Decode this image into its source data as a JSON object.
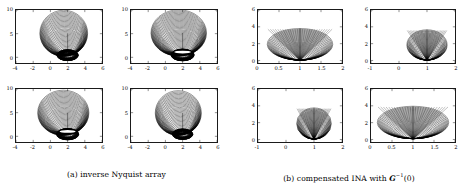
{
  "figure": {
    "background": "#ffffff",
    "axis_color": "#1a1a1a",
    "curve_color": "#000000"
  },
  "captions": {
    "a": {
      "tag": "(a)",
      "text": "inverse Nyquist array",
      "full": "(a) inverse Nyquist array"
    },
    "b": {
      "tag": "(b)",
      "text_before": "compensated INA with",
      "symbol": "G",
      "exponent": "−1",
      "arg": "(0)",
      "full": "(b) compensated INA with G−1(0)"
    }
  },
  "chart_data": [
    {
      "id": "a-11",
      "group": "a",
      "row": 0,
      "col": 0,
      "type": "line",
      "title": "",
      "xlabel": "",
      "ylabel": "",
      "xlim": [
        -4,
        6
      ],
      "ylim": [
        -1.2,
        10
      ],
      "xticks": [
        -4,
        -2,
        0,
        2,
        4,
        6
      ],
      "xticklabels": [
        "-4",
        "-2",
        "0",
        "2",
        "4",
        "6"
      ],
      "yticks": [
        0,
        5,
        10
      ],
      "yticklabels": [
        "0",
        "5",
        "10"
      ],
      "grid": false,
      "legend": null,
      "shape": "nyquist-band-bulb",
      "band_count": 34,
      "description": "Family of nested Gershgorin-type ovals forming a wide lobe from y=10 down to a dense dark bulb centred near x=2, y=0",
      "center_x": 1.55,
      "lobe_top_y": 9.7,
      "lobe_width": 5.2,
      "bulb_center": [
        2.0,
        0.45
      ],
      "bulb_radius": 1.25,
      "has_white_slit": false
    },
    {
      "id": "a-12",
      "group": "a",
      "row": 0,
      "col": 1,
      "type": "line",
      "xlim": [
        -4,
        6
      ],
      "ylim": [
        -1.2,
        10
      ],
      "xticks": [
        -4,
        -2,
        0,
        2,
        4,
        6
      ],
      "xticklabels": [
        "-4",
        "-2",
        "0",
        "2",
        "4",
        "6"
      ],
      "yticks": [
        0,
        5,
        10
      ],
      "yticklabels": [
        "0",
        "5",
        "10"
      ],
      "grid": false,
      "shape": "nyquist-band-bulb",
      "band_count": 36,
      "center_x": 1.55,
      "lobe_top_y": 9.8,
      "lobe_width": 6.1,
      "bulb_center": [
        2.0,
        0.5
      ],
      "bulb_radius": 1.35,
      "has_white_slit": true
    },
    {
      "id": "a-21",
      "group": "a",
      "row": 1,
      "col": 0,
      "type": "line",
      "xlim": [
        -4,
        6
      ],
      "ylim": [
        -1.2,
        10
      ],
      "xticks": [
        -4,
        -2,
        0,
        2,
        4,
        6
      ],
      "xticklabels": [
        "-4",
        "-2",
        "0",
        "2",
        "4",
        "6"
      ],
      "yticks": [
        0,
        5,
        10
      ],
      "yticklabels": [
        "0",
        "5",
        "10"
      ],
      "grid": false,
      "shape": "nyquist-band-bulb",
      "band_count": 34,
      "center_x": 1.5,
      "lobe_top_y": 9.5,
      "lobe_width": 5.6,
      "bulb_center": [
        2.0,
        0.45
      ],
      "bulb_radius": 1.3,
      "has_white_slit": true
    },
    {
      "id": "a-22",
      "group": "a",
      "row": 1,
      "col": 1,
      "type": "line",
      "xlim": [
        -4,
        6
      ],
      "ylim": [
        -1.2,
        10
      ],
      "xticks": [
        -4,
        -2,
        0,
        2,
        4,
        6
      ],
      "xticklabels": [
        "-4",
        "-2",
        "0",
        "2",
        "4",
        "6"
      ],
      "yticks": [
        0,
        5,
        10
      ],
      "yticklabels": [
        "0",
        "5",
        "10"
      ],
      "grid": false,
      "shape": "nyquist-band-bulb",
      "band_count": 32,
      "center_x": 1.5,
      "lobe_top_y": 9.4,
      "lobe_width": 5.0,
      "bulb_center": [
        2.0,
        0.45
      ],
      "bulb_radius": 1.2,
      "has_white_slit": false
    },
    {
      "id": "b-11",
      "group": "b",
      "row": 0,
      "col": 0,
      "type": "line",
      "xlim": [
        0,
        2
      ],
      "ylim": [
        -0.3,
        6
      ],
      "xticks": [
        0,
        0.5,
        1,
        1.5,
        2
      ],
      "xticklabels": [
        "0",
        "0.5",
        "1",
        "1.5",
        "2"
      ],
      "yticks": [
        0,
        2,
        4,
        6
      ],
      "yticklabels": [
        "0",
        "2",
        "4",
        "6"
      ],
      "grid": false,
      "shape": "cone-funnel",
      "band_count": 30,
      "description": "Nested ellipses converging to a narrow point at (1,0) forming a V / cone shape, widest at the top near y=3.7",
      "apex": [
        1.0,
        0.0
      ],
      "top_y": 3.75,
      "top_half_width": 0.78
    },
    {
      "id": "b-12",
      "group": "b",
      "row": 0,
      "col": 1,
      "type": "line",
      "xlim": [
        -1,
        2
      ],
      "ylim": [
        -0.3,
        6
      ],
      "xticks": [
        -1,
        0,
        1,
        2
      ],
      "xticklabels": [
        "-1",
        "0",
        "1",
        "2"
      ],
      "yticks": [
        0,
        2,
        4,
        6
      ],
      "yticklabels": [
        "0",
        "2",
        "4",
        "6"
      ],
      "grid": false,
      "shape": "cone-funnel",
      "band_count": 28,
      "apex": [
        1.0,
        0.0
      ],
      "top_y": 3.6,
      "top_half_width": 0.72
    },
    {
      "id": "b-21",
      "group": "b",
      "row": 1,
      "col": 0,
      "type": "line",
      "xlim": [
        -1,
        2
      ],
      "ylim": [
        -0.3,
        6
      ],
      "xticks": [
        -1,
        0,
        1,
        2
      ],
      "xticklabels": [
        "-1",
        "0",
        "1",
        "2"
      ],
      "yticks": [
        0,
        2,
        4,
        6
      ],
      "yticklabels": [
        "0",
        "2",
        "4",
        "6"
      ],
      "grid": false,
      "shape": "cone-funnel",
      "band_count": 28,
      "apex": [
        1.0,
        0.0
      ],
      "top_y": 3.7,
      "top_half_width": 0.62
    },
    {
      "id": "b-22",
      "group": "b",
      "row": 1,
      "col": 1,
      "type": "line",
      "xlim": [
        0,
        2
      ],
      "ylim": [
        -0.3,
        6
      ],
      "xticks": [
        0,
        0.5,
        1,
        1.5,
        2
      ],
      "xticklabels": [
        "0",
        "0.5",
        "1",
        "1.5",
        "2"
      ],
      "yticks": [
        0,
        2,
        4,
        6
      ],
      "yticklabels": [
        "0",
        "2",
        "4",
        "6"
      ],
      "grid": false,
      "shape": "cone-funnel",
      "band_count": 30,
      "apex": [
        1.0,
        0.05
      ],
      "top_y": 3.9,
      "top_half_width": 0.85
    }
  ]
}
